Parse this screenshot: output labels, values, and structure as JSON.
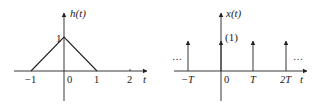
{
  "left_plot": {
    "ylabel": "h(t)",
    "xlabel": "t",
    "peak_label": "1",
    "ticks": [
      {
        "label": "−1",
        "x": 31
      },
      {
        "label": "0",
        "x": 70
      },
      {
        "label": "1",
        "x": 97
      },
      {
        "label": "2",
        "x": 130
      }
    ]
  },
  "right_plot": {
    "ylabel": "x(t)",
    "xlabel": "t",
    "impulse_weight": "(1)",
    "ellipsis_left": "…",
    "ellipsis_right": "…",
    "ticks": [
      {
        "label": "−T",
        "x": 188
      },
      {
        "label": "0",
        "x": 227
      },
      {
        "label": "T",
        "x": 253
      },
      {
        "label": "2T",
        "x": 286
      }
    ]
  },
  "colors": {
    "line": "#222222",
    "background": "#ffffff"
  }
}
